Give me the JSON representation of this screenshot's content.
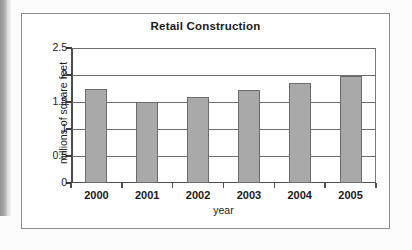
{
  "chart_data": {
    "type": "bar",
    "title": "Retail Construction",
    "xlabel": "year",
    "ylabel": "millions of square feet",
    "categories": [
      "2000",
      "2001",
      "2002",
      "2003",
      "2004",
      "2005"
    ],
    "values": [
      1.75,
      1.5,
      1.6,
      1.72,
      1.85,
      1.98
    ],
    "ylim": [
      0,
      2.5
    ],
    "ytick_labels": [
      "2.5",
      "2",
      "1.5",
      "1",
      "0.5",
      "0"
    ],
    "ytick_values": [
      2.5,
      2,
      1.5,
      1,
      0.5,
      0
    ],
    "grid": true,
    "legend": "none",
    "bar_color": "#a9a9a9",
    "bar_edge_color": "#6b6b6b",
    "axis_color": "#4d4d4d",
    "gridline_color": "#6e6e6e",
    "frame_color": "#8c8c8c",
    "background_color": "#ffffff"
  }
}
